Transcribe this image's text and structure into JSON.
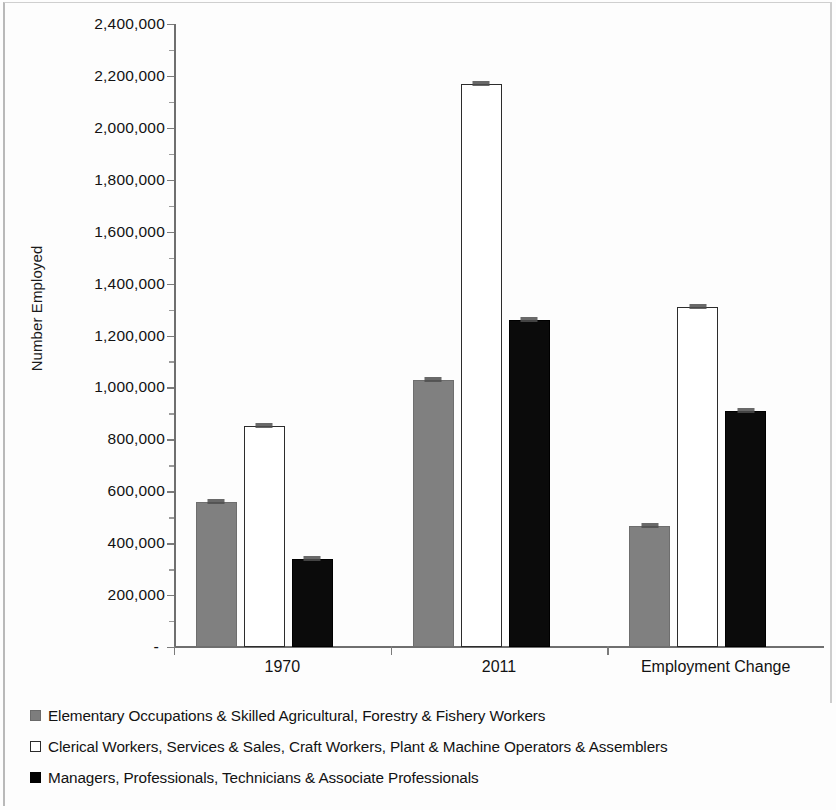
{
  "chart_data": {
    "type": "bar",
    "title": "",
    "xlabel": "",
    "ylabel": "Number Employed",
    "categories": [
      "1970",
      "2011",
      "Employment Change"
    ],
    "ylim": [
      0,
      2400000
    ],
    "ytick_values": [
      0,
      200000,
      400000,
      600000,
      800000,
      1000000,
      1200000,
      1400000,
      1600000,
      1800000,
      2000000,
      2200000,
      2400000
    ],
    "ytick_labels": [
      "-",
      "200,000",
      "400,000",
      "600,000",
      "800,000",
      "1,000,000",
      "1,200,000",
      "1,400,000",
      "1,600,000",
      "1,800,000",
      "2,000,000",
      "2,200,000",
      "2,400,000"
    ],
    "grid": false,
    "legend_position": "bottom-left",
    "series": [
      {
        "name": "Elementary Occupations & Skilled Agricultural, Forestry & Fishery Workers",
        "color": "#808080",
        "style": "gray",
        "values": [
          560000,
          1030000,
          465000
        ]
      },
      {
        "name": "Clerical Workers, Services & Sales, Craft Workers, Plant & Machine Operators & Assemblers",
        "color": "#ffffff",
        "style": "white",
        "values": [
          850000,
          2170000,
          1310000
        ]
      },
      {
        "name": "Managers, Professionals, Technicians & Associate Professionals",
        "color": "#000000",
        "style": "black",
        "values": [
          340000,
          1260000,
          910000
        ]
      }
    ]
  }
}
